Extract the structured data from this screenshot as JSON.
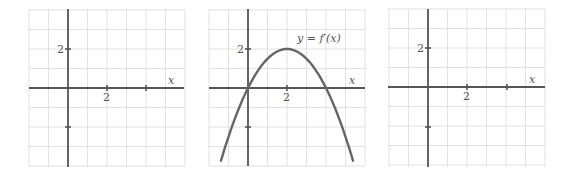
{
  "figure": {
    "panels": [
      {
        "id": "left-blank-graph",
        "x_axis_label": "x",
        "x_tick_label": "2",
        "y_tick_label": "2",
        "curve_label": null
      },
      {
        "id": "middle-derivative-graph",
        "x_axis_label": "x",
        "x_tick_label": "2",
        "y_tick_label": "2",
        "curve_label": "y = f′(x)"
      },
      {
        "id": "right-blank-graph",
        "x_axis_label": "x",
        "x_tick_label": "2",
        "y_tick_label": "2",
        "curve_label": null
      }
    ]
  },
  "chart_data": [
    {
      "type": "line",
      "title": "",
      "xlabel": "x",
      "ylabel": "",
      "xlim": [
        -2,
        6
      ],
      "ylim": [
        -4,
        4
      ],
      "grid": true,
      "grid_step": 1,
      "x_ticks": [
        {
          "value": 2,
          "label": "2"
        },
        {
          "value": 4,
          "label": ""
        }
      ],
      "y_ticks": [
        {
          "value": 2,
          "label": "2"
        },
        {
          "value": -2,
          "label": ""
        }
      ],
      "series": []
    },
    {
      "type": "line",
      "title": "",
      "xlabel": "x",
      "ylabel": "",
      "xlim": [
        -2,
        6
      ],
      "ylim": [
        -4,
        4
      ],
      "grid": true,
      "grid_step": 1,
      "x_ticks": [
        {
          "value": 2,
          "label": "2"
        },
        {
          "value": 4,
          "label": ""
        }
      ],
      "y_ticks": [
        {
          "value": 2,
          "label": "2"
        },
        {
          "value": -2,
          "label": ""
        }
      ],
      "annotations": [
        {
          "text": "y = f′(x)",
          "x": 3.3,
          "y": 3.4
        }
      ],
      "series": [
        {
          "name": "y = f′(x)",
          "description": "Downward parabola, vertex (2, 2), zeros at x = 0 and x = 4",
          "x": [
            -1.4,
            -1,
            0,
            1,
            2,
            3,
            4,
            5,
            5.4
          ],
          "values": [
            -3.78,
            -2.5,
            0,
            1.5,
            2,
            1.5,
            0,
            -2.5,
            -3.78
          ]
        }
      ]
    },
    {
      "type": "line",
      "title": "",
      "xlabel": "x",
      "ylabel": "",
      "xlim": [
        -2,
        6
      ],
      "ylim": [
        -4,
        4
      ],
      "grid": true,
      "grid_step": 1,
      "x_ticks": [
        {
          "value": 2,
          "label": "2"
        },
        {
          "value": 4,
          "label": ""
        }
      ],
      "y_ticks": [
        {
          "value": 2,
          "label": "2"
        },
        {
          "value": -2,
          "label": ""
        }
      ],
      "series": []
    }
  ]
}
